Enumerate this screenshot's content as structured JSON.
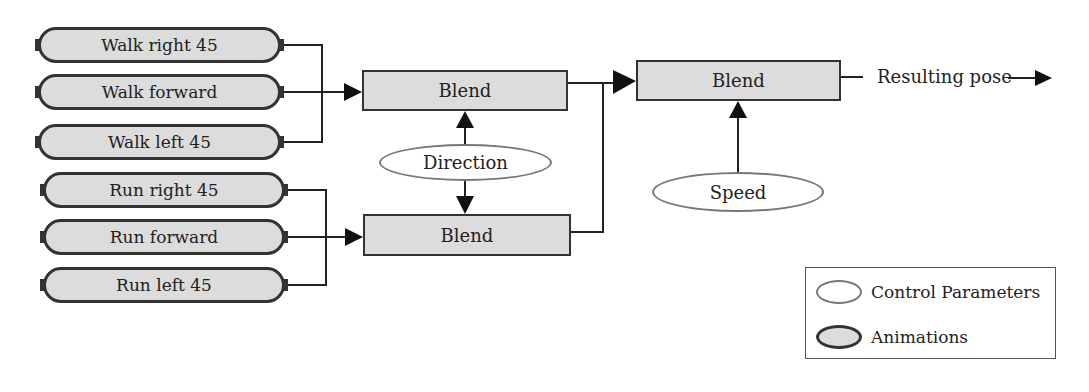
{
  "animations": [
    {
      "label": "Walk right 45",
      "group": "walk"
    },
    {
      "label": "Walk forward",
      "group": "walk"
    },
    {
      "label": "Walk left 45",
      "group": "walk"
    },
    {
      "label": "Run right 45",
      "group": "run"
    },
    {
      "label": "Run forward",
      "group": "run"
    },
    {
      "label": "Run left 45",
      "group": "run"
    }
  ],
  "blend_nodes": {
    "walk_blend": "Blend",
    "run_blend": "Blend",
    "final_blend": "Blend"
  },
  "control_parameters": {
    "direction": "Direction",
    "speed": "Speed"
  },
  "output": {
    "label": "Resulting pose"
  },
  "legend": {
    "items": [
      {
        "label": "Control Parameters",
        "shape": "white-ellipse"
      },
      {
        "label": "Animations",
        "shape": "gray-ellipse"
      }
    ]
  },
  "colors": {
    "node_fill": "#dcdcdc",
    "stroke": "#333333",
    "parameter_stroke": "#777777",
    "background": "#ffffff"
  }
}
